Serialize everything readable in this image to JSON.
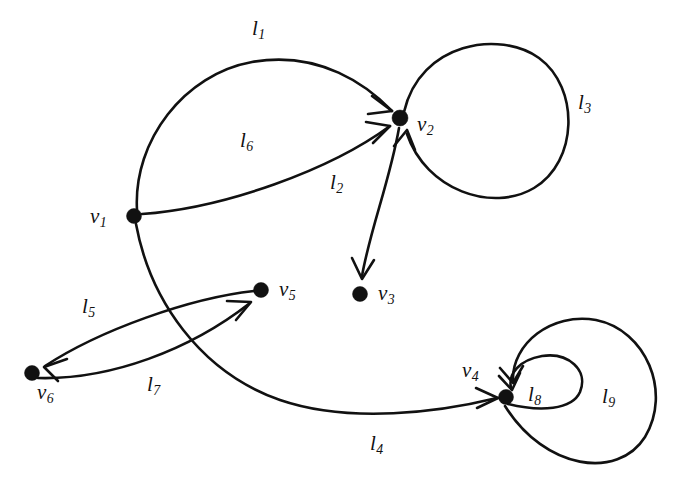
{
  "figure": {
    "kind": "directed-multigraph",
    "background_color": "#ffffff",
    "ink_color": "#111111"
  },
  "vertices": [
    {
      "id": "v1",
      "label": "v",
      "sub": "1",
      "x": 134,
      "y": 216,
      "label_x": 90,
      "label_y": 206,
      "r": 7.5
    },
    {
      "id": "v2",
      "label": "v",
      "sub": "2",
      "x": 400,
      "y": 118,
      "label_x": 417,
      "label_y": 114,
      "r": 8.0
    },
    {
      "id": "v3",
      "label": "v",
      "sub": "3",
      "x": 360,
      "y": 294,
      "label_x": 378,
      "label_y": 283,
      "r": 7.5
    },
    {
      "id": "v4",
      "label": "v",
      "sub": "4",
      "x": 506,
      "y": 397,
      "label_x": 462,
      "label_y": 360,
      "r": 7.5
    },
    {
      "id": "v5",
      "label": "v",
      "sub": "5",
      "x": 261,
      "y": 290,
      "label_x": 279,
      "label_y": 279,
      "r": 7.5
    },
    {
      "id": "v6",
      "label": "v",
      "sub": "6",
      "x": 32,
      "y": 373,
      "label_x": 37,
      "label_y": 382,
      "r": 7.5
    }
  ],
  "edges": [
    {
      "id": "l1",
      "label": "l",
      "sub": "1",
      "from": "v1",
      "to": "v2",
      "kind": "arc",
      "label_x": 252,
      "label_y": 18
    },
    {
      "id": "l2",
      "label": "l",
      "sub": "2",
      "from": "v2",
      "to": "v3",
      "kind": "arc",
      "label_x": 330,
      "label_y": 172
    },
    {
      "id": "l3",
      "label": "l",
      "sub": "3",
      "from": "v2",
      "to": "v2",
      "kind": "loop",
      "label_x": 578,
      "label_y": 92
    },
    {
      "id": "l4",
      "label": "l",
      "sub": "4",
      "from": "v1",
      "to": "v4",
      "kind": "arc",
      "label_x": 370,
      "label_y": 433
    },
    {
      "id": "l5",
      "label": "l",
      "sub": "5",
      "from": "v5",
      "to": "v6",
      "kind": "arc",
      "label_x": 82,
      "label_y": 296
    },
    {
      "id": "l6",
      "label": "l",
      "sub": "6",
      "from": "v1",
      "to": "v2",
      "kind": "arc",
      "label_x": 240,
      "label_y": 130
    },
    {
      "id": "l7",
      "label": "l",
      "sub": "7",
      "from": "v6",
      "to": "v5",
      "kind": "arc",
      "label_x": 147,
      "label_y": 374
    },
    {
      "id": "l8",
      "label": "l",
      "sub": "8",
      "from": "v4",
      "to": "v4",
      "kind": "loop",
      "label_x": 528,
      "label_y": 384
    },
    {
      "id": "l9",
      "label": "l",
      "sub": "9",
      "from": "v4",
      "to": "v4",
      "kind": "loop",
      "label_x": 602,
      "label_y": 386
    }
  ]
}
